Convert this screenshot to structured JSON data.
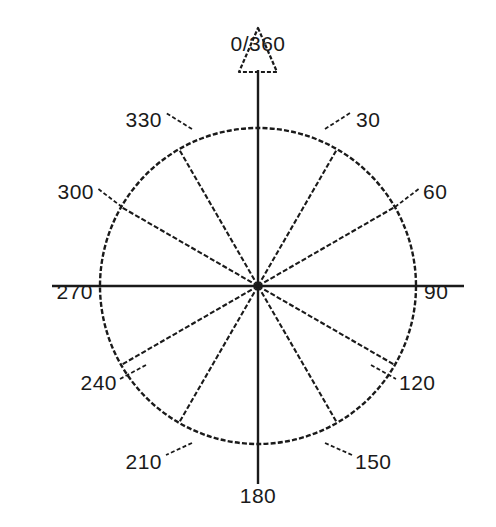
{
  "diagram": {
    "type": "compass-rose",
    "title": "",
    "background_color": "#ffffff",
    "stroke_color": "#1a1a1a",
    "center": {
      "x": 258,
      "y": 286
    },
    "radius": 158,
    "spoke_interval_degrees": 30,
    "spoke_count": 12,
    "north_marker": {
      "name": "north-arrow",
      "shape": "hollow-triangle",
      "filled": false,
      "label": "0/360"
    },
    "axis_overshoot": {
      "vertical_label": "180",
      "horizontal_labels": [
        "270",
        "90"
      ]
    },
    "labels": [
      {
        "text": "0/360",
        "degrees": 0,
        "anchor": "middle",
        "x": 258,
        "y": 45,
        "leader": false
      },
      {
        "text": "30",
        "degrees": 30,
        "anchor": "start",
        "x": 356,
        "y": 121,
        "leader": true,
        "lx1": 325,
        "ly1": 129,
        "lx2": 350,
        "ly2": 113
      },
      {
        "text": "60",
        "degrees": 60,
        "anchor": "start",
        "x": 423,
        "y": 193,
        "leader": true,
        "lx1": 395,
        "ly1": 207,
        "lx2": 420,
        "ly2": 188
      },
      {
        "text": "90",
        "degrees": 90,
        "anchor": "start",
        "x": 424,
        "y": 293,
        "leader": false
      },
      {
        "text": "120",
        "degrees": 120,
        "anchor": "start",
        "x": 399,
        "y": 384,
        "leader": true,
        "lx1": 371,
        "ly1": 365,
        "lx2": 396,
        "ly2": 379
      },
      {
        "text": "150",
        "degrees": 150,
        "anchor": "start",
        "x": 355,
        "y": 463,
        "leader": true,
        "lx1": 325,
        "ly1": 443,
        "lx2": 352,
        "ly2": 455
      },
      {
        "text": "180",
        "degrees": 180,
        "anchor": "middle",
        "x": 258,
        "y": 497,
        "leader": false
      },
      {
        "text": "210",
        "degrees": 210,
        "anchor": "end",
        "x": 162,
        "y": 463,
        "leader": true,
        "lx1": 192,
        "ly1": 443,
        "lx2": 166,
        "ly2": 455
      },
      {
        "text": "240",
        "degrees": 240,
        "anchor": "end",
        "x": 117,
        "y": 384,
        "leader": true,
        "lx1": 146,
        "ly1": 365,
        "lx2": 120,
        "ly2": 379
      },
      {
        "text": "270",
        "degrees": 270,
        "anchor": "end",
        "x": 93,
        "y": 293,
        "leader": false
      },
      {
        "text": "300",
        "degrees": 300,
        "anchor": "end",
        "x": 94,
        "y": 193,
        "leader": true,
        "lx1": 122,
        "ly1": 207,
        "lx2": 97,
        "ly2": 188
      },
      {
        "text": "330",
        "degrees": 330,
        "anchor": "end",
        "x": 162,
        "y": 121,
        "leader": true,
        "lx1": 192,
        "ly1": 129,
        "lx2": 166,
        "ly2": 113
      }
    ]
  }
}
